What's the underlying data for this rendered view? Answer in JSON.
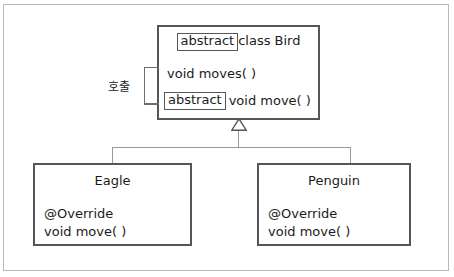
{
  "diagram": {
    "type": "uml-class-diagram",
    "relationship": "generalization",
    "colors": {
      "box_border": "#56565a",
      "connector": "#9a9a9e",
      "bracket": "#6e6e72",
      "text": "#1b1b1b",
      "frame": "#b9b9b9",
      "background": "#ffffff"
    },
    "superclass": {
      "name": "Bird",
      "keyword": "abstract",
      "title_suffix": "class Bird",
      "members": [
        {
          "keyword": null,
          "signature": "void moves( )"
        },
        {
          "keyword": "abstract",
          "signature": "void move( )"
        }
      ]
    },
    "annotation": {
      "label": "호출",
      "meaning": "call",
      "connects": [
        "void moves( )",
        "abstract void move( )"
      ]
    },
    "subclasses": [
      {
        "name": "Eagle",
        "members": [
          "@Override",
          "void move( )"
        ]
      },
      {
        "name": "Penguin",
        "members": [
          "@Override",
          "void move( )"
        ]
      }
    ],
    "icons": {
      "generalization": "hollow-triangle-arrow"
    }
  }
}
